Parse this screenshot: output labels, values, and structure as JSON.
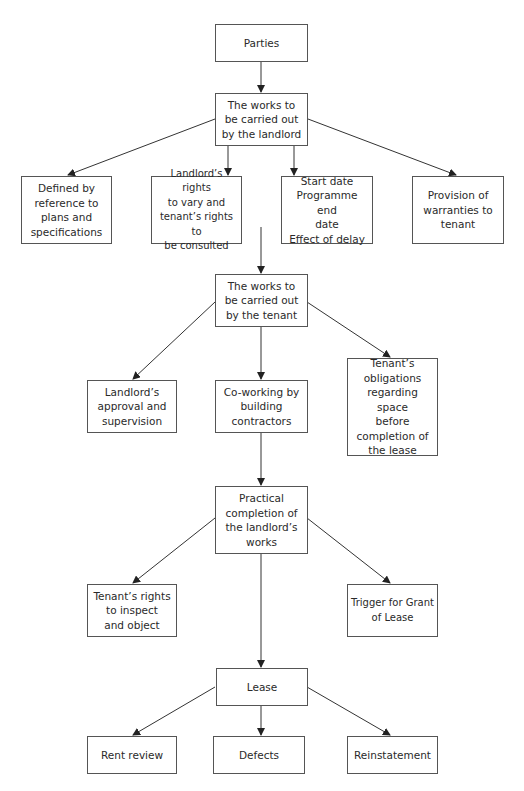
{
  "diagram": {
    "colors": {
      "line": "#333333",
      "border": "#555555",
      "text": "#2a2a2a",
      "background": "#ffffff"
    },
    "nodes": {
      "parties": "Parties",
      "landlord_works": "The works to\nbe carried out\nby the landlord",
      "defined_by": "Defined by\nreference to\nplans and\nspecifications",
      "landlord_rights": "Landlord’s rights\nto vary and\ntenant’s rights to\nbe consulted",
      "dates": "Start date\nProgramme end\ndate\nEffect of delay",
      "warranties": "Provision of\nwarranties to\ntenant",
      "tenant_works": "The works to\nbe carried out\nby the tenant",
      "landlord_approval": "Landlord’s\napproval and\nsupervision",
      "coworking": "Co-working by\nbuilding\ncontractors",
      "tenant_obligations": "Tenant’s\nobligations\nregarding space\nbefore\ncompletion of\nthe lease",
      "practical_completion": "Practical\ncompletion of\nthe landlord’s\nworks",
      "tenant_inspect": "Tenant’s rights\nto inspect\nand object",
      "trigger_grant": "Trigger for Grant\nof Lease",
      "lease": "Lease",
      "rent_review": "Rent review",
      "defects": "Defects",
      "reinstatement": "Reinstatement"
    },
    "edges": [
      [
        "parties",
        "landlord_works"
      ],
      [
        "landlord_works",
        "defined_by"
      ],
      [
        "landlord_works",
        "landlord_rights"
      ],
      [
        "landlord_works",
        "dates"
      ],
      [
        "landlord_works",
        "warranties"
      ],
      [
        "landlord_works",
        "tenant_works"
      ],
      [
        "tenant_works",
        "landlord_approval"
      ],
      [
        "tenant_works",
        "coworking"
      ],
      [
        "tenant_works",
        "tenant_obligations"
      ],
      [
        "coworking",
        "practical_completion"
      ],
      [
        "practical_completion",
        "tenant_inspect"
      ],
      [
        "practical_completion",
        "trigger_grant"
      ],
      [
        "practical_completion",
        "lease"
      ],
      [
        "lease",
        "rent_review"
      ],
      [
        "lease",
        "defects"
      ],
      [
        "lease",
        "reinstatement"
      ]
    ]
  }
}
